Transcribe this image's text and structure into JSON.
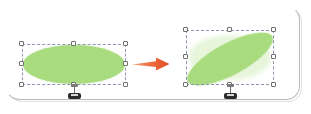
{
  "scene": {
    "title": "Shape rotation illustration",
    "background_color": "#ffffff",
    "frame": {
      "name": "rounded-panel",
      "border_color": "#b9b9b9",
      "corner_radius_px": 14
    },
    "transition": {
      "icon": "right-arrow-icon",
      "color": "#e8532a",
      "label": "rotate"
    },
    "shapes": [
      {
        "id": "before",
        "name": "ellipse-unrotated",
        "fill_color": "#a9db7f",
        "rotation_deg": 0,
        "selected": true,
        "selection_border_color": "#8f95b5",
        "handle_fill": "#fdfdfd",
        "handle_border": "#707070",
        "handles": [
          "top-left",
          "top-center",
          "top-right",
          "middle-left",
          "middle-right",
          "bottom-left",
          "bottom-center",
          "bottom-right"
        ],
        "rotate_handle": "rotation-handle-bottom"
      },
      {
        "id": "after",
        "name": "ellipse-rotated",
        "fill_color": "#a9db7f",
        "rotation_deg": -28,
        "selected": true,
        "selection_border_color": "#8f95b5",
        "handle_fill": "#fdfdfd",
        "handle_border": "#707070",
        "handles": [
          "top-left",
          "top-center",
          "top-right",
          "middle-left",
          "middle-right",
          "bottom-left",
          "bottom-center",
          "bottom-right"
        ],
        "rotate_handle": "rotation-handle-bottom"
      }
    ]
  }
}
